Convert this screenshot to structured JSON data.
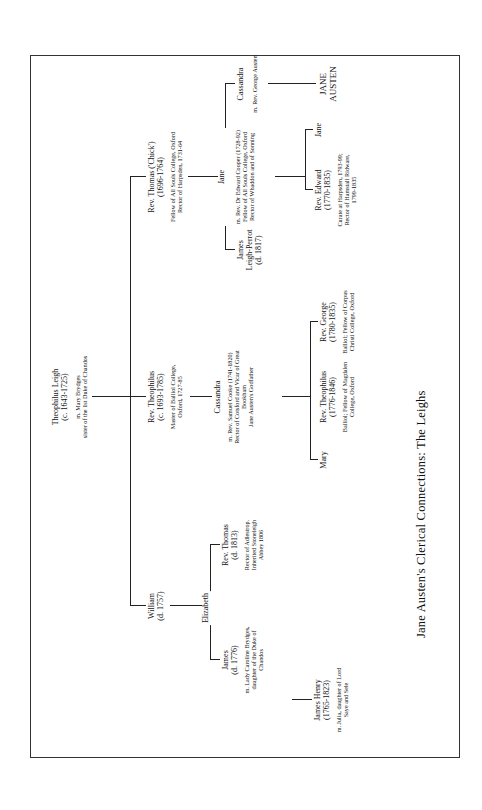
{
  "title": "Jane Austen's Clerical Connections:  The Leighs",
  "root": {
    "name": "Theophilus Leigh",
    "dates": "(c. 1643-1725)",
    "spouse": "m. Mary Brydges",
    "spouse_note": "sister of the 1st Duke of Chandos"
  },
  "generation2": {
    "william": {
      "name": "William",
      "dates": "(d. 1757)"
    },
    "theophilus": {
      "name": "Rev. Theophilus",
      "dates": "(c. 1693-1785)",
      "note": [
        "Master of Balliol College,",
        "Oxford, 1727-85"
      ]
    },
    "thomas": {
      "name": "Rev. Thomas ('Chick')",
      "dates": "(1696-1764)",
      "note": [
        "Fellow of All Souls College, Oxford",
        "Rector of Harpsden, 1731-64"
      ]
    }
  },
  "generation3": {
    "james": {
      "name": "James",
      "dates": "(d. 1776)",
      "note": [
        "m. Lady Caroline Brydges,",
        "daughter of the Duke of",
        "Chandos"
      ]
    },
    "elizabeth": {
      "name": "Elizabeth"
    },
    "rev_thomas": {
      "name": "Rev. Thomas",
      "dates": "(d. 1813)",
      "note": [
        "Rector of Adlestrop.",
        "Inherited Stoneleigh",
        "Abbey 1806"
      ]
    },
    "cassandra_cooke": {
      "name": "Cassandra",
      "note": [
        "m. Rev. Samuel Cooke (1741-1820)",
        "Rector of Cotsford and Vicar of Great",
        "Bookham",
        "Jane Austen's Godfather"
      ]
    },
    "james_leigh_perrot": {
      "name": "James",
      "name2": "Leigh-Perrot",
      "dates": "(d. 1817)"
    },
    "jane_cooper": {
      "name": "Jane",
      "note": [
        "m. Rev. Dr Edward Cooper (1728-92)",
        "Fellow of All Souls College, Oxford",
        "Rector of Whaddon and of Sonning"
      ]
    },
    "cassandra_austen": {
      "name": "Cassandra",
      "note": [
        "m. Rev. George Austen"
      ]
    }
  },
  "generation4": {
    "james_henry": {
      "name": "James Henry",
      "dates": "(1765-1823)",
      "note": [
        "m. Julia, daughter of Lord",
        "Saye and Sele"
      ]
    },
    "mary": {
      "name": "Mary"
    },
    "rev_theophilus": {
      "name": "Rev. Theophilus",
      "dates": "(1776-1846)",
      "note": [
        "Balliol; Fellow of Magdalen",
        "College, Oxford"
      ]
    },
    "rev_george": {
      "name": "Rev. George",
      "dates": "(1780-1835)",
      "note": [
        "Balliol; Fellow of Corpus",
        "Christi College, Oxford"
      ]
    },
    "rev_edward": {
      "name": "Rev. Edward",
      "dates": "(1770-1835)",
      "note": [
        "Curate at Harpsden, 1793-99;",
        "Rector of Hamstall Ridware,",
        "1799-1835"
      ]
    },
    "jane": {
      "name": "Jane"
    },
    "jane_austen": {
      "name": "JANE",
      "name2": "AUSTEN"
    }
  }
}
